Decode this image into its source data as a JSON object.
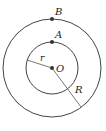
{
  "diagram": {
    "type": "concentric-circles",
    "center": {
      "label": "O",
      "x": 52,
      "y": 68
    },
    "outer_circle": {
      "radius": 49,
      "radius_label": "R"
    },
    "inner_circle": {
      "radius": 26,
      "radius_label": "r"
    },
    "points": [
      {
        "label": "B",
        "x": 52,
        "y": 19
      },
      {
        "label": "A",
        "x": 52,
        "y": 42
      }
    ],
    "colors": {
      "stroke": "#444444",
      "point": "#333333"
    }
  }
}
